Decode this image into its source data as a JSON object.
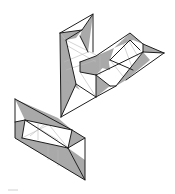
{
  "figure": {
    "colors": {
      "background": "#ffffff",
      "shade": "#a9a9a9",
      "edge": "#1e1e1e",
      "hidden_edge": "#b8b8b8"
    },
    "shapes": [
      {
        "name": "upper-folded-shape"
      },
      {
        "name": "lower-folded-shape"
      }
    ]
  }
}
